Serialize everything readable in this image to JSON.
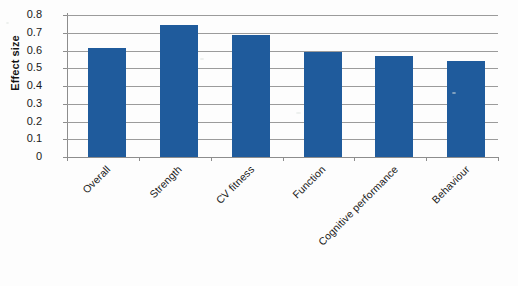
{
  "chart_data": {
    "type": "bar",
    "title": "",
    "xlabel": "",
    "ylabel": "Effect size",
    "categories": [
      "Overall",
      "Strength",
      "CV fitness",
      "Function",
      "Cognitive performance",
      "Behaviour"
    ],
    "values": [
      0.615,
      0.745,
      0.69,
      0.59,
      0.57,
      0.54
    ],
    "series": [
      {
        "name": "Effect size",
        "values": [
          0.615,
          0.745,
          0.69,
          0.59,
          0.57,
          0.54
        ]
      }
    ],
    "ylim": [
      0,
      0.8
    ],
    "ytick_labels": [
      "0.8",
      "0.7",
      "0.6",
      "0.5",
      "0.4",
      "0.3",
      "0.2",
      "0.1",
      "0"
    ],
    "ytick_values": [
      0.8,
      0.7,
      0.6,
      0.5,
      0.4,
      0.3,
      0.2,
      0.1,
      0
    ],
    "grid": true,
    "legend": false,
    "legend_position": "none",
    "bar_color": "#1f5b9c",
    "gridline_color": "#9b9b9b",
    "background_color": "#fdfdfd",
    "xtick_label_rotation": -45
  }
}
